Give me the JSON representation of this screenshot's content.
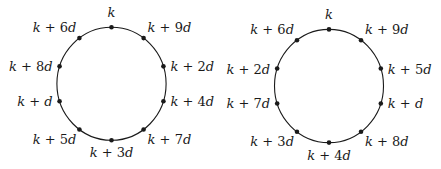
{
  "colors": {
    "ink": "#1a1a1a",
    "background": "#ffffff"
  },
  "diagrams": [
    {
      "name": "left-circle",
      "center": [
        111.5,
        83.8
      ],
      "rx": 54.6,
      "ry": 56.5,
      "points": [
        {
          "angle": 90,
          "label": "k",
          "anchor": "middle",
          "dx": 0,
          "dy": -10
        },
        {
          "angle": 54,
          "label": "k + 9d",
          "anchor": "start",
          "dx": 4,
          "dy": -6
        },
        {
          "angle": 18,
          "label": "k + 2d",
          "anchor": "start",
          "dx": 7,
          "dy": 5
        },
        {
          "angle": -18,
          "label": "k + 4d",
          "anchor": "start",
          "dx": 7,
          "dy": 5
        },
        {
          "angle": -54,
          "label": "k + 7d",
          "anchor": "start",
          "dx": 4,
          "dy": 14
        },
        {
          "angle": -90,
          "label": "k + 3d",
          "anchor": "middle",
          "dx": 0,
          "dy": 17
        },
        {
          "angle": -126,
          "label": "k + 5d",
          "anchor": "end",
          "dx": -3,
          "dy": 14
        },
        {
          "angle": -162,
          "label": "k + d",
          "anchor": "end",
          "dx": -7,
          "dy": 5
        },
        {
          "angle": 162,
          "label": "k + 8d",
          "anchor": "end",
          "dx": -7,
          "dy": 5
        },
        {
          "angle": 126,
          "label": "k + 6d",
          "anchor": "end",
          "dx": -3,
          "dy": -6
        }
      ]
    },
    {
      "name": "right-circle",
      "center": [
        329.0,
        86.0
      ],
      "rx": 54.5,
      "ry": 56.6,
      "points": [
        {
          "angle": 90,
          "label": "k",
          "anchor": "middle",
          "dx": 0,
          "dy": -10
        },
        {
          "angle": 54,
          "label": "k + 9d",
          "anchor": "start",
          "dx": 4,
          "dy": -6
        },
        {
          "angle": 18,
          "label": "k + 5d",
          "anchor": "start",
          "dx": 7,
          "dy": 5
        },
        {
          "angle": -18,
          "label": "k + d",
          "anchor": "start",
          "dx": 7,
          "dy": 5
        },
        {
          "angle": -54,
          "label": "k + 8d",
          "anchor": "start",
          "dx": 4,
          "dy": 14
        },
        {
          "angle": -90,
          "label": "k + 4d",
          "anchor": "middle",
          "dx": 0,
          "dy": 17
        },
        {
          "angle": -126,
          "label": "k + 3d",
          "anchor": "end",
          "dx": -3,
          "dy": 14
        },
        {
          "angle": -162,
          "label": "k + 7d",
          "anchor": "end",
          "dx": -7,
          "dy": 5
        },
        {
          "angle": 162,
          "label": "k + 2d",
          "anchor": "end",
          "dx": -7,
          "dy": 5
        },
        {
          "angle": 126,
          "label": "k + 6d",
          "anchor": "end",
          "dx": -3,
          "dy": -6
        }
      ]
    }
  ]
}
